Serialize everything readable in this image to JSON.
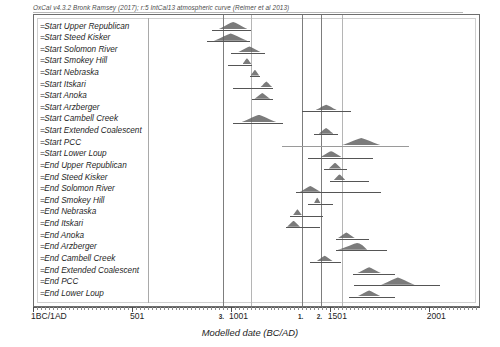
{
  "credit": "OxCal v4.3.2 Bronk Ramsey (2017); r:5 IntCal13 atmospheric curve (Reimer et al 2013)",
  "axis": {
    "title": "Modelled date (BC/AD)",
    "ticks": [
      {
        "label": "1BC/1AD",
        "value": 1
      },
      {
        "label": "501",
        "value": 501
      },
      {
        "label": "1001",
        "value": 1001
      },
      {
        "label": "1501",
        "value": 1501
      },
      {
        "label": "2001",
        "value": 2001
      }
    ],
    "marker_labels": [
      {
        "label": "3.",
        "value": 960
      },
      {
        "label": "1.",
        "value": 1360
      },
      {
        "label": "2.",
        "value": 1455
      }
    ]
  },
  "chart_data": {
    "type": "bar",
    "title": "OxCal v4.3.2 Bronk Ramsey (2017); r:5 IntCal13 atmospheric curve (Reimer et al 2013)",
    "xlabel": "Modelled date (BC/AD)",
    "ylabel": "",
    "xlim": [
      1,
      2260
    ],
    "grid": true,
    "legend": "none",
    "reference_lines": [
      960,
      1100,
      1360,
      1455,
      1560
    ],
    "categories": [
      "Start Upper Republican",
      "Start Steed Kisker",
      "Start Solomon River",
      "Start Smokey Hill",
      "Start Nebraska",
      "Start Itskari",
      "Start Anoka",
      "Start Arzberger",
      "Start Cambell Creek",
      "Start Extended Coalescent",
      "Start PCC",
      "Start Lower Loup",
      "End Upper Republican",
      "End Steed Kisker",
      "End Solomon River",
      "End Smokey Hill",
      "End Nebraska",
      "End Itskari",
      "End Anoka",
      "End Arzberger",
      "End Cambell Creek",
      "End Extended Coalescent",
      "End PCC",
      "End Lower Loup"
    ],
    "values": [
      {
        "label": "Start Upper Republican",
        "mode": 1010,
        "range_start": 905,
        "range_end": 1105,
        "dist_start": 940,
        "dist_end": 1085
      },
      {
        "label": "Start Steed Kisker",
        "mode": 1000,
        "range_start": 880,
        "range_end": 1100,
        "dist_start": 915,
        "dist_end": 1085
      },
      {
        "label": "Start Solomon River",
        "mode": 1095,
        "range_start": 1000,
        "range_end": 1175,
        "dist_start": 1035,
        "dist_end": 1155
      },
      {
        "label": "Start Smokey Hill",
        "mode": 1085,
        "range_start": 985,
        "range_end": 1110,
        "dist_start": 1060,
        "dist_end": 1105
      },
      {
        "label": "Start Nebraska",
        "mode": 1120,
        "range_start": 1095,
        "range_end": 1150,
        "dist_start": 1100,
        "dist_end": 1145
      },
      {
        "label": "Start Itskari",
        "mode": 1180,
        "range_start": 1010,
        "range_end": 1215,
        "dist_start": 1150,
        "dist_end": 1210
      },
      {
        "label": "Start Anoka",
        "mode": 1155,
        "range_start": 1105,
        "range_end": 1215,
        "dist_start": 1120,
        "dist_end": 1200
      },
      {
        "label": "Start Arzberger",
        "mode": 1475,
        "range_start": 1360,
        "range_end": 1610,
        "dist_start": 1425,
        "dist_end": 1540
      },
      {
        "label": "Start Cambell Creek",
        "mode": 1135,
        "range_start": 1010,
        "range_end": 1265,
        "dist_start": 1055,
        "dist_end": 1230
      },
      {
        "label": "Start Extended Coalescent",
        "mode": 1480,
        "range_start": 1420,
        "range_end": 1545,
        "dist_start": 1445,
        "dist_end": 1520
      },
      {
        "label": "Start PCC",
        "mode": 1650,
        "range_start": 1260,
        "range_end": 1900,
        "dist_start": 1560,
        "dist_end": 1760
      },
      {
        "label": "Start Lower Loup",
        "mode": 1505,
        "range_start": 1390,
        "range_end": 1720,
        "dist_start": 1455,
        "dist_end": 1560
      },
      {
        "label": "End Upper Republican",
        "mode": 1525,
        "range_start": 1470,
        "range_end": 1590,
        "dist_start": 1495,
        "dist_end": 1560
      },
      {
        "label": "End Steed Kisker",
        "mode": 1545,
        "range_start": 1500,
        "range_end": 1700,
        "dist_start": 1520,
        "dist_end": 1580
      },
      {
        "label": "End Solomon River",
        "mode": 1400,
        "range_start": 1330,
        "range_end": 1760,
        "dist_start": 1350,
        "dist_end": 1455
      },
      {
        "label": "End Smokey Hill",
        "mode": 1435,
        "range_start": 1390,
        "range_end": 1520,
        "dist_start": 1420,
        "dist_end": 1455
      },
      {
        "label": "End Nebraska",
        "mode": 1335,
        "range_start": 1300,
        "range_end": 1465,
        "dist_start": 1315,
        "dist_end": 1360
      },
      {
        "label": "End Itskari",
        "mode": 1315,
        "range_start": 1280,
        "range_end": 1450,
        "dist_start": 1285,
        "dist_end": 1350
      },
      {
        "label": "End Anoka",
        "mode": 1575,
        "range_start": 1530,
        "range_end": 1700,
        "dist_start": 1540,
        "dist_end": 1630
      },
      {
        "label": "End Arzberger",
        "mode": 1580,
        "range_start": 1530,
        "range_end": 1790,
        "dist_start": 1540,
        "dist_end": 1690
      },
      {
        "label": "End Cambell Creek",
        "mode": 1470,
        "range_start": 1400,
        "range_end": 1560,
        "dist_start": 1430,
        "dist_end": 1520
      },
      {
        "label": "End Extended Coalescent",
        "mode": 1690,
        "range_start": 1620,
        "range_end": 1830,
        "dist_start": 1640,
        "dist_end": 1760
      },
      {
        "label": "End PCC",
        "mode": 1830,
        "range_start": 1625,
        "range_end": 2060,
        "dist_start": 1760,
        "dist_end": 1930
      },
      {
        "label": "End Lower Loup",
        "mode": 1690,
        "range_start": 1600,
        "range_end": 1830,
        "dist_start": 1640,
        "dist_end": 1760
      }
    ]
  }
}
